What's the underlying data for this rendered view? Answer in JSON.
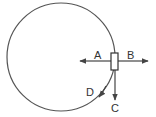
{
  "diagram": {
    "type": "circular-motion-forces",
    "colors": {
      "stroke": "#444444",
      "background": "#ffffff",
      "text": "#333333"
    },
    "circle": {
      "cx": 61,
      "cy": 57,
      "r": 54
    },
    "object": {
      "shape": "rectangle",
      "x": 111,
      "y": 53,
      "width": 7,
      "height": 17
    },
    "arrows": [
      {
        "id": "A",
        "label": "A",
        "direction": "left (toward center)"
      },
      {
        "id": "B",
        "label": "B",
        "direction": "right (away from center)"
      },
      {
        "id": "C",
        "label": "C",
        "direction": "down (tangent)"
      },
      {
        "id": "D",
        "label": "D",
        "direction": "along circular path"
      }
    ]
  }
}
